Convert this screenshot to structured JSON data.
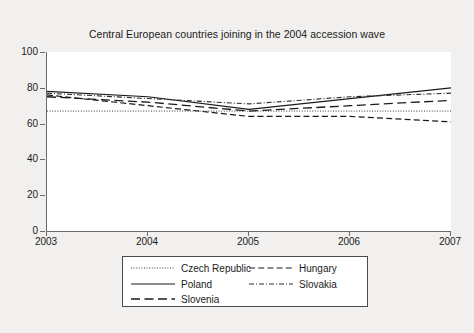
{
  "chart_data": {
    "type": "line",
    "title": "Central European countries joining in the 2004 accession wave",
    "xlabel": "",
    "ylabel": "",
    "x": [
      2003,
      2004,
      2005,
      2006,
      2007
    ],
    "categories": [
      "2003",
      "2004",
      "2005",
      "2006",
      "2007"
    ],
    "xlim": [
      2003,
      2007
    ],
    "ylim": [
      0,
      100
    ],
    "yticks": [
      0,
      20,
      40,
      60,
      80,
      100
    ],
    "xticks": [
      2003,
      2004,
      2005,
      2006,
      2007
    ],
    "grid": false,
    "legend_position": "bottom",
    "series": [
      {
        "name": "Czech Republic",
        "style": "dotted",
        "color": "#3a3a3a",
        "values": [
          67,
          67,
          67,
          67,
          67
        ]
      },
      {
        "name": "Poland",
        "style": "solid",
        "color": "#1b1b1b",
        "values": [
          78,
          75,
          68,
          74,
          80
        ]
      },
      {
        "name": "Slovenia",
        "style": "long-dash",
        "color": "#1b1b1b",
        "values": [
          75,
          72,
          67,
          70,
          73
        ]
      },
      {
        "name": "Hungary",
        "style": "dashed",
        "color": "#1b1b1b",
        "values": [
          76,
          70,
          64,
          64,
          61
        ]
      },
      {
        "name": "Slovakia",
        "style": "dash-dot",
        "color": "#2a2a2a",
        "values": [
          77,
          74,
          71,
          75,
          77
        ]
      }
    ]
  },
  "axis": {
    "y_tick_labels": [
      "100",
      "80",
      "60",
      "40",
      "20",
      "0"
    ],
    "x_tick_labels": [
      "2003",
      "2004",
      "2005",
      "2006",
      "2007"
    ]
  },
  "legend": {
    "entries": [
      {
        "label": "Czech Republic"
      },
      {
        "label": "Poland"
      },
      {
        "label": "Slovenia"
      },
      {
        "label": "Hungary"
      },
      {
        "label": "Slovakia"
      }
    ]
  },
  "colors": {
    "page_background": "#f1f0ee",
    "plot_background": "#ffffff",
    "axis": "#6b6b6b",
    "text": "#1b1b1b",
    "legend_border": "#4a4a4a"
  }
}
